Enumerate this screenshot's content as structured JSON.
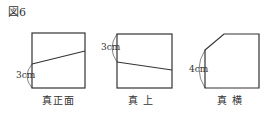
{
  "figure": {
    "title": "図6",
    "views": [
      {
        "caption": "真正面",
        "dimension": "3cm"
      },
      {
        "caption": "真 上",
        "dimension": "3cm"
      },
      {
        "caption": "真 横",
        "dimension": "4cm"
      }
    ],
    "line_color": "#333333"
  }
}
